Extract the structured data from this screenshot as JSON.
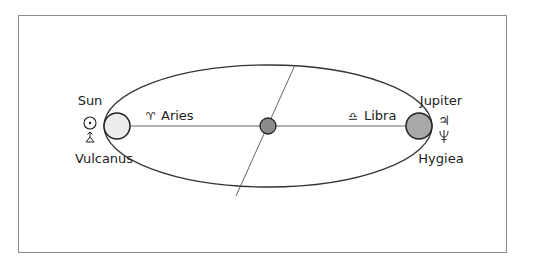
{
  "diagram": {
    "left_body": {
      "name_top": "Sun",
      "name_bottom": "Vulcanus",
      "symbol_top": "☉",
      "symbol_bottom": "⩮",
      "fill": "#ececec"
    },
    "right_body": {
      "name_top": "Jupiter",
      "name_bottom": "Hygiea",
      "symbol_top": "♃",
      "symbol_bottom": "⯺",
      "fill": "#a8a8a8"
    },
    "center_body": {
      "fill": "#8c8c8c"
    },
    "signs": {
      "left": {
        "symbol": "♈",
        "label": "Aries"
      },
      "right": {
        "symbol": "♎",
        "label": "Libra"
      }
    },
    "colors": {
      "stroke": "#333333",
      "frame": "#8a8a8a"
    }
  }
}
